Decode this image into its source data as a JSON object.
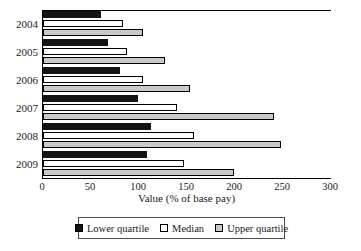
{
  "chart_data": {
    "type": "bar",
    "orientation": "horizontal",
    "title": "",
    "xlabel": "Value (% of base pay)",
    "ylabel": "",
    "categories": [
      "2004",
      "2005",
      "2006",
      "2007",
      "2008",
      "2009"
    ],
    "series": [
      {
        "name": "Lower quartile",
        "color": "#141414",
        "values": [
          60,
          68,
          80,
          99,
          113,
          108
        ]
      },
      {
        "name": "Median",
        "color": "#ffffff",
        "values": [
          83,
          88,
          104,
          140,
          157,
          147
        ]
      },
      {
        "name": "Upper quartile",
        "color": "#c9c9c9",
        "values": [
          104,
          127,
          153,
          241,
          248,
          199
        ]
      }
    ],
    "xlim": [
      0,
      300
    ],
    "xticks": [
      0,
      50,
      100,
      150,
      200,
      250,
      300
    ],
    "xtick_labels": [
      "0",
      "50",
      "100",
      "150",
      "200",
      "250",
      "300"
    ],
    "grid": false,
    "legend_position": "bottom",
    "legend_entries": [
      "Lower quartile",
      "Median",
      "Upper quartile"
    ]
  }
}
